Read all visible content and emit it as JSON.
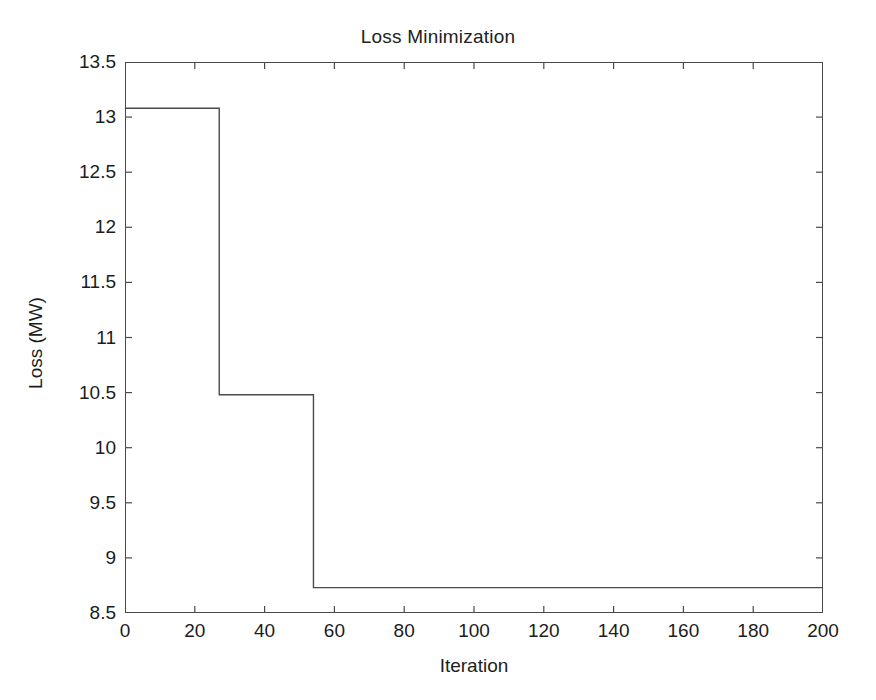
{
  "chart_data": {
    "type": "line",
    "title": "Loss Minimization",
    "xlabel": "Iteration",
    "ylabel": "Loss (MW)",
    "xlim": [
      0,
      200
    ],
    "ylim": [
      8.5,
      13.5
    ],
    "x_ticks": [
      0,
      20,
      40,
      60,
      80,
      100,
      120,
      140,
      160,
      180,
      200
    ],
    "y_ticks": [
      8.5,
      9,
      9.5,
      10,
      10.5,
      11,
      11.5,
      12,
      12.5,
      13,
      13.5
    ],
    "x_tick_labels": [
      "0",
      "20",
      "40",
      "60",
      "80",
      "100",
      "120",
      "140",
      "160",
      "180",
      "200"
    ],
    "y_tick_labels": [
      "8.5",
      "9",
      "9.5",
      "10",
      "10.5",
      "11",
      "11.5",
      "12",
      "12.5",
      "13",
      "13.5"
    ],
    "grid": false,
    "legend": null,
    "line_color": "#4a4a4a",
    "step_style": "post",
    "series": [
      {
        "name": "Loss",
        "x": [
          0,
          27,
          27,
          54,
          54,
          200
        ],
        "y": [
          13.08,
          13.08,
          10.48,
          10.48,
          8.73,
          8.73
        ]
      }
    ],
    "steps": [
      {
        "from_iteration": 0,
        "to_iteration": 27,
        "loss_mw": 13.08
      },
      {
        "from_iteration": 27,
        "to_iteration": 54,
        "loss_mw": 10.48
      },
      {
        "from_iteration": 54,
        "to_iteration": 200,
        "loss_mw": 8.73
      }
    ],
    "initial_loss_mw": 13.08,
    "final_loss_mw": 8.73
  },
  "figure": {
    "background_color": "#ffffff",
    "axis_color": "#4a4a4a",
    "text_color": "#1c1c1c"
  }
}
